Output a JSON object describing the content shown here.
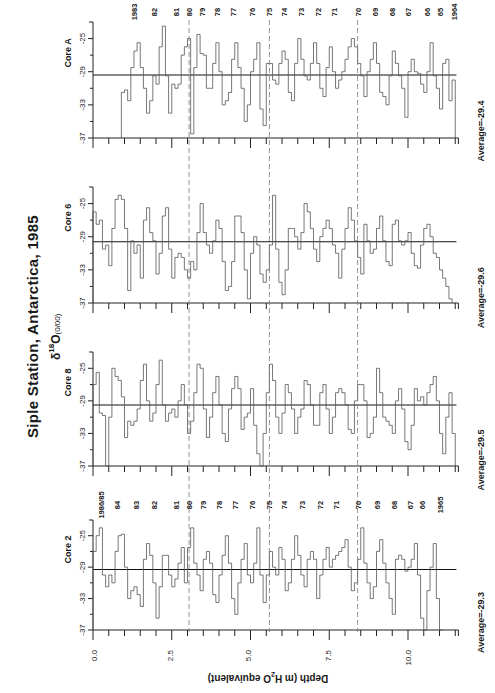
{
  "title": "Siple Station, Antarctica, 1985",
  "y_label": "δ18O(0/00)",
  "y_label_parts": {
    "delta": "δ",
    "sup": "18",
    "o": "O",
    "unit": "(0/00)"
  },
  "x_axis": {
    "title_parts": {
      "a": "Depth  (m H",
      "sub": "2",
      "b": "O equivalent)"
    },
    "ticks": [
      "0.0",
      "2.5",
      "5.0",
      "7.5",
      "10.0"
    ]
  },
  "y_ticks": [
    "-25",
    "-29",
    "-33",
    "-37"
  ],
  "cores": [
    {
      "name": "Core A",
      "average_label": "Average=-29.4"
    },
    {
      "name": "Core 6",
      "average_label": "Average=-29.6"
    },
    {
      "name": "Core 8",
      "average_label": "Average=-29.5"
    },
    {
      "name": "Core 2",
      "average_label": "Average=-29.3"
    }
  ],
  "year_labels_core_a": [
    "1983",
    "82",
    "81",
    "80",
    "79",
    "78",
    "77",
    "76",
    "75",
    "74",
    "73",
    "72",
    "71",
    "70",
    "69",
    "68",
    "67",
    "66",
    "65",
    "1964"
  ],
  "year_labels_core_2": [
    "1986/85",
    "84",
    "83",
    "82",
    "81",
    "80",
    "79",
    "78",
    "77",
    "76",
    "75",
    "74",
    "73",
    "72",
    "71",
    "70",
    "69",
    "68",
    "67",
    "66",
    "1965"
  ],
  "chart_data": {
    "type": "line",
    "title": "Siple Station, Antarctica, 1985",
    "xlabel": "Depth (m H2O equivalent)",
    "ylabel": "δ18O (‰)",
    "xlim": [
      0,
      11.6
    ],
    "ylim": [
      -37,
      -23
    ],
    "x_ticks": [
      0.0,
      2.5,
      5.0,
      7.5,
      10.0
    ],
    "y_ticks": [
      -25,
      -29,
      -33,
      -37
    ],
    "grid": false,
    "dashed_reference_depths_m": [
      3.05,
      5.6,
      8.4
    ],
    "dashed_reference_years": [
      "1980",
      "1975",
      "1970"
    ],
    "step_plot": true,
    "series": [
      {
        "name": "Core A",
        "average": -29.4,
        "depth_range_m": [
          0.9,
          11.45
        ],
        "year_range": [
          "1983",
          "1964"
        ],
        "year_marker_depths_m": [
          1.3,
          1.95,
          2.65,
          3.05,
          3.45,
          3.95,
          4.45,
          5.05,
          5.6,
          6.05,
          6.6,
          7.15,
          7.65,
          8.4,
          8.95,
          9.5,
          10.0,
          10.6,
          11.0,
          11.45
        ],
        "x": [
          0.9,
          1.0,
          1.1,
          1.2,
          1.3,
          1.4,
          1.5,
          1.6,
          1.7,
          1.8,
          1.9,
          2.0,
          2.1,
          2.2,
          2.3,
          2.4,
          2.5,
          2.6,
          2.7,
          2.8,
          2.9,
          3.0,
          3.1,
          3.2,
          3.3,
          3.4,
          3.5,
          3.6,
          3.7,
          3.8,
          3.9,
          4.0,
          4.1,
          4.2,
          4.3,
          4.4,
          4.5,
          4.6,
          4.7,
          4.8,
          4.9,
          5.0,
          5.1,
          5.2,
          5.3,
          5.4,
          5.5,
          5.6,
          5.7,
          5.8,
          5.9,
          6.0,
          6.1,
          6.2,
          6.3,
          6.4,
          6.5,
          6.6,
          6.7,
          6.8,
          6.9,
          7.0,
          7.1,
          7.2,
          7.3,
          7.4,
          7.5,
          7.6,
          7.7,
          7.8,
          7.9,
          8.0,
          8.1,
          8.2,
          8.3,
          8.4,
          8.5,
          8.6,
          8.7,
          8.8,
          8.9,
          9.0,
          9.1,
          9.2,
          9.3,
          9.4,
          9.5,
          9.6,
          9.7,
          9.8,
          9.9,
          10.0,
          10.1,
          10.2,
          10.3,
          10.4,
          10.5,
          10.6,
          10.7,
          10.8,
          10.9,
          11.0,
          11.1,
          11.2,
          11.3,
          11.4
        ],
        "values": [
          -31.5,
          -31.2,
          -32.5,
          -28.5,
          -26.5,
          -25.5,
          -28.5,
          -31,
          -34,
          -32.5,
          -29.5,
          -30.5,
          -26,
          -23.5,
          -29.5,
          -34,
          -30.5,
          -31,
          -30.5,
          -27,
          -26,
          -25,
          -36.5,
          -28.5,
          -24.5,
          -26.8,
          -27,
          -31,
          -31,
          -28,
          -25.5,
          -29,
          -33,
          -32.5,
          -31.5,
          -27.5,
          -25.5,
          -28.5,
          -31,
          -35,
          -33,
          -29,
          -27.5,
          -25.5,
          -33.5,
          -35.5,
          -28,
          -28,
          -30,
          -30.5,
          -28,
          -26.5,
          -27.5,
          -31.5,
          -32.5,
          -28,
          -25,
          -27.5,
          -29.5,
          -30,
          -28,
          -25.5,
          -28,
          -31,
          -32,
          -28.5,
          -26,
          -29,
          -31,
          -30,
          -29,
          -27.5,
          -26,
          -25,
          -26,
          -28,
          -29.5,
          -32,
          -29,
          -27.5,
          -25.5,
          -28,
          -31.5,
          -32,
          -33,
          -29.5,
          -26.5,
          -28,
          -29.5,
          -31,
          -34.5,
          -29,
          -27.5,
          -29,
          -29.2,
          -30.5,
          -31.5,
          -29,
          -25.5,
          -29.5,
          -31,
          -33.5,
          -28,
          -27.5,
          -32.5,
          -30
        ]
      },
      {
        "name": "Core 6",
        "average": -29.6,
        "depth_range_m": [
          0.0,
          11.35
        ],
        "x": [
          0.0,
          0.1,
          0.2,
          0.3,
          0.4,
          0.5,
          0.6,
          0.7,
          0.8,
          0.9,
          1.0,
          1.1,
          1.2,
          1.3,
          1.4,
          1.5,
          1.6,
          1.7,
          1.8,
          1.9,
          2.0,
          2.1,
          2.2,
          2.3,
          2.4,
          2.5,
          2.6,
          2.7,
          2.8,
          2.9,
          3.0,
          3.1,
          3.2,
          3.3,
          3.4,
          3.5,
          3.6,
          3.7,
          3.8,
          3.9,
          4.0,
          4.1,
          4.2,
          4.3,
          4.4,
          4.5,
          4.6,
          4.7,
          4.8,
          4.9,
          5.0,
          5.1,
          5.2,
          5.3,
          5.4,
          5.5,
          5.6,
          5.7,
          5.8,
          5.9,
          6.0,
          6.1,
          6.2,
          6.3,
          6.4,
          6.5,
          6.6,
          6.7,
          6.8,
          6.9,
          7.0,
          7.1,
          7.2,
          7.3,
          7.4,
          7.5,
          7.6,
          7.7,
          7.8,
          7.9,
          8.0,
          8.1,
          8.2,
          8.3,
          8.4,
          8.5,
          8.6,
          8.7,
          8.8,
          8.9,
          9.0,
          9.1,
          9.2,
          9.3,
          9.4,
          9.5,
          9.6,
          9.7,
          9.8,
          9.9,
          10.0,
          10.1,
          10.2,
          10.3,
          10.4,
          10.5,
          10.6,
          10.7,
          10.8,
          10.9,
          11.0,
          11.1,
          11.2,
          11.3
        ],
        "values": [
          -26,
          -27.5,
          -27,
          -30.5,
          -30,
          -32.5,
          -28,
          -24.5,
          -24,
          -24.5,
          -28,
          -35.5,
          -29.5,
          -31,
          -30,
          -34,
          -27,
          -25.5,
          -28.5,
          -29.5,
          -33.5,
          -31,
          -26.5,
          -25.5,
          -30.5,
          -34,
          -31.5,
          -31,
          -31.5,
          -33,
          -34,
          -32,
          -33,
          -28.5,
          -25,
          -28.5,
          -30,
          -31,
          -29.5,
          -27,
          -28,
          -32,
          -35.5,
          -35,
          -32,
          -26.5,
          -26.5,
          -28.5,
          -33,
          -36.5,
          -31,
          -29,
          -30,
          -33.5,
          -34.5,
          -33,
          -30,
          -24,
          -30.5,
          -34.5,
          -36,
          -33,
          -28,
          -28,
          -29,
          -30.5,
          -28.5,
          -25,
          -26,
          -28,
          -30.5,
          -32,
          -29,
          -28,
          -27,
          -28,
          -30,
          -31,
          -34,
          -30.5,
          -28,
          -25.5,
          -27,
          -29.5,
          -31.5,
          -33.5,
          -27.5,
          -29.5,
          -31,
          -30.5,
          -28,
          -26.5,
          -29.5,
          -32,
          -32.5,
          -27.5,
          -27,
          -29.5,
          -30,
          -29.5,
          -28.5,
          -31,
          -32.5,
          -32.8,
          -30,
          -28,
          -27.5,
          -29,
          -31,
          -31.5,
          -33,
          -34,
          -35,
          -36.5
        ]
      },
      {
        "name": "Core 8",
        "average": -29.5,
        "depth_range_m": [
          0.0,
          11.45
        ],
        "x": [
          0.0,
          0.1,
          0.2,
          0.3,
          0.4,
          0.5,
          0.6,
          0.7,
          0.8,
          0.9,
          1.0,
          1.1,
          1.2,
          1.3,
          1.4,
          1.5,
          1.6,
          1.7,
          1.8,
          1.9,
          2.0,
          2.1,
          2.2,
          2.3,
          2.4,
          2.5,
          2.6,
          2.7,
          2.8,
          2.9,
          3.0,
          3.1,
          3.2,
          3.3,
          3.4,
          3.5,
          3.6,
          3.7,
          3.8,
          3.9,
          4.0,
          4.1,
          4.2,
          4.3,
          4.4,
          4.5,
          4.6,
          4.7,
          4.8,
          4.9,
          5.0,
          5.1,
          5.2,
          5.3,
          5.4,
          5.5,
          5.6,
          5.7,
          5.8,
          5.9,
          6.0,
          6.1,
          6.2,
          6.3,
          6.4,
          6.5,
          6.6,
          6.7,
          6.8,
          6.9,
          7.0,
          7.1,
          7.2,
          7.3,
          7.4,
          7.5,
          7.6,
          7.7,
          7.8,
          7.9,
          8.0,
          8.1,
          8.2,
          8.3,
          8.4,
          8.5,
          8.6,
          8.7,
          8.8,
          8.9,
          9.0,
          9.1,
          9.2,
          9.3,
          9.4,
          9.5,
          9.6,
          9.7,
          9.8,
          9.9,
          10.0,
          10.1,
          10.2,
          10.3,
          10.4,
          10.5,
          10.6,
          10.7,
          10.8,
          10.9,
          11.0,
          11.1,
          11.2,
          11.3,
          11.4
        ],
        "values": [
          -27,
          -25.5,
          -30.5,
          -30.8,
          -37,
          -31,
          -25,
          -26,
          -26.5,
          -28.5,
          -33.5,
          -31.5,
          -32,
          -31.5,
          -30,
          -26.5,
          -24.5,
          -29,
          -31.5,
          -30.5,
          -27,
          -24,
          -29.5,
          -31.5,
          -30.5,
          -30,
          -31,
          -29,
          -27,
          -29.5,
          -33,
          -31.5,
          -28,
          -24.5,
          -25,
          -30,
          -33.5,
          -31,
          -28,
          -26,
          -29.5,
          -33,
          -34,
          -30,
          -27.5,
          -26,
          -27.5,
          -32.5,
          -31,
          -30.5,
          -27.5,
          -32,
          -35.5,
          -37,
          -33,
          -28,
          -24.5,
          -26.5,
          -31,
          -33,
          -30.5,
          -27,
          -28,
          -30,
          -33,
          -31,
          -30,
          -26.5,
          -27,
          -29.5,
          -32,
          -32,
          -28,
          -27,
          -30,
          -33,
          -31,
          -28,
          -27.5,
          -28,
          -29.5,
          -32.5,
          -33,
          -29,
          -27,
          -27,
          -29,
          -33.5,
          -33,
          -31,
          -25,
          -28,
          -31,
          -31.5,
          -32,
          -33,
          -29,
          -27.5,
          -30,
          -34,
          -35,
          -32,
          -27.5,
          -29,
          -28.5,
          -29.5,
          -28,
          -27,
          -26,
          -29,
          -33,
          -35.5,
          -31,
          -28,
          -33
        ]
      },
      {
        "name": "Core 2",
        "average": -29.3,
        "depth_range_m": [
          0.0,
          11.1
        ],
        "year_range": [
          "1986/85",
          "1965"
        ],
        "year_marker_depths_m": [
          0.25,
          0.75,
          1.35,
          1.95,
          2.65,
          3.05,
          3.5,
          4.0,
          4.5,
          5.05,
          5.6,
          6.05,
          6.65,
          7.2,
          7.7,
          8.4,
          9.0,
          9.55,
          10.05,
          10.45,
          11.0
        ],
        "x": [
          0.0,
          0.1,
          0.2,
          0.3,
          0.4,
          0.5,
          0.6,
          0.7,
          0.8,
          0.9,
          1.0,
          1.1,
          1.2,
          1.3,
          1.4,
          1.5,
          1.6,
          1.7,
          1.8,
          1.9,
          2.0,
          2.1,
          2.2,
          2.3,
          2.4,
          2.5,
          2.6,
          2.7,
          2.8,
          2.9,
          3.0,
          3.1,
          3.2,
          3.3,
          3.4,
          3.5,
          3.6,
          3.7,
          3.8,
          3.9,
          4.0,
          4.1,
          4.2,
          4.3,
          4.4,
          4.5,
          4.6,
          4.7,
          4.8,
          4.9,
          5.0,
          5.1,
          5.2,
          5.3,
          5.4,
          5.5,
          5.6,
          5.7,
          5.8,
          5.9,
          6.0,
          6.1,
          6.2,
          6.3,
          6.4,
          6.5,
          6.6,
          6.7,
          6.8,
          6.9,
          7.0,
          7.1,
          7.2,
          7.3,
          7.4,
          7.5,
          7.6,
          7.7,
          7.8,
          7.9,
          8.0,
          8.1,
          8.2,
          8.3,
          8.4,
          8.5,
          8.6,
          8.7,
          8.8,
          8.9,
          9.0,
          9.1,
          9.2,
          9.3,
          9.4,
          9.5,
          9.6,
          9.7,
          9.8,
          9.9,
          10.0,
          10.1,
          10.2,
          10.3,
          10.4,
          10.5,
          10.6,
          10.7,
          10.8,
          10.9,
          11.0
        ],
        "values": [
          -27,
          -25,
          -24,
          -30,
          -31.5,
          -30,
          -31,
          -27,
          -25,
          -24.8,
          -29,
          -33,
          -32,
          -31.5,
          -32.5,
          -34,
          -28,
          -26,
          -27.5,
          -31,
          -35.5,
          -31.5,
          -27.5,
          -27.5,
          -30,
          -31.5,
          -30.5,
          -28.5,
          -26.5,
          -31,
          -26.5,
          -24,
          -28.5,
          -30,
          -32,
          -28,
          -27,
          -28.5,
          -32.5,
          -33.5,
          -30,
          -27.5,
          -25,
          -28.5,
          -33,
          -35,
          -31,
          -28,
          -26,
          -30,
          -31,
          -28.5,
          -24,
          -30,
          -33.5,
          -30,
          -27,
          -29,
          -30,
          -26.5,
          -28,
          -32,
          -31,
          -28,
          -25,
          -27.5,
          -30,
          -31.5,
          -28,
          -27,
          -28,
          -33,
          -30,
          -28,
          -26.5,
          -29,
          -28,
          -27.5,
          -27,
          -26.5,
          -25.5,
          -29,
          -32,
          -31,
          -28,
          -24,
          -28.5,
          -31,
          -33,
          -31.5,
          -27,
          -25.5,
          -28.5,
          -31,
          -33,
          -35,
          -28,
          -27.5,
          -28,
          -29.5,
          -29,
          -28,
          -26,
          -30,
          -35.5,
          -37,
          -32,
          -29,
          -26,
          -33,
          -37
        ]
      }
    ]
  }
}
